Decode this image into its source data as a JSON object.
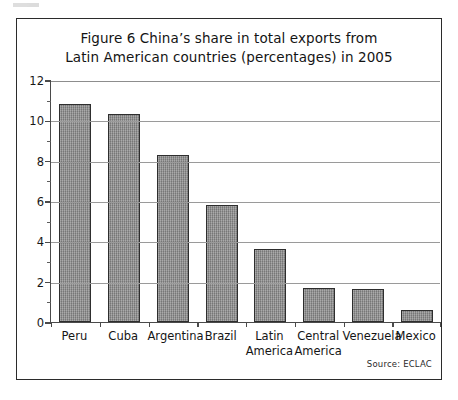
{
  "figure": {
    "title_line1": "Figure 6 China’s share in total exports from",
    "title_line2": "Latin American countries (percentages) in 2005",
    "source": "Source: ECLAC"
  },
  "chart_data": {
    "type": "bar",
    "title": "Figure 6 China’s share in total exports from Latin American countries (percentages) in 2005",
    "xlabel": "",
    "ylabel": "",
    "ylim": [
      0,
      12
    ],
    "ytick_step": 2,
    "yticks": [
      "0",
      "2",
      "4",
      "6",
      "8",
      "10",
      "12"
    ],
    "minor_ticks": true,
    "grid": true,
    "legend": false,
    "categories": [
      "Peru",
      "Cuba",
      "Argentina",
      "Brazil",
      "Latin America",
      "Central America",
      "Venezuela",
      "Mexico"
    ],
    "category_lines": [
      [
        "Peru",
        ""
      ],
      [
        "Cuba",
        ""
      ],
      [
        "Argentina",
        ""
      ],
      [
        "Brazil",
        ""
      ],
      [
        "Latin",
        "America"
      ],
      [
        "Central",
        "America"
      ],
      [
        "Venezuela",
        ""
      ],
      [
        "Mexico",
        ""
      ]
    ],
    "values": [
      10.8,
      10.3,
      8.3,
      5.8,
      3.6,
      1.7,
      1.65,
      0.6
    ],
    "units": "percent",
    "source": "ECLAC",
    "bar_color": "#8e8e8e",
    "bar_border_color": "#2e2e2e",
    "grid_color": "#9a9a9a",
    "axis_color": "#4a4a4a"
  }
}
